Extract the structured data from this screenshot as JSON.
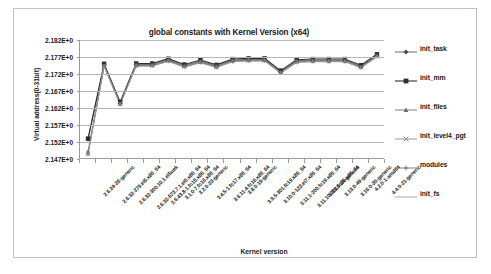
{
  "chart_data": {
    "type": "line",
    "title": "global constants with Kernel Version (x64)",
    "xlabel": "Kernel version",
    "ylabel": "Virtual address(0-31bit)",
    "ylim": [
      2.147,
      2.182
    ],
    "ytick_labels": [
      "2.182E+0",
      "2.177E+0",
      "2.172E+0",
      "2.167E+0",
      "2.162E+0",
      "2.157E+0",
      "2.152E+0",
      "2.147E+0"
    ],
    "ytick_values": [
      2.182,
      2.177,
      2.172,
      2.167,
      2.162,
      2.157,
      2.152,
      2.147
    ],
    "grid": true,
    "legend_position": "right",
    "categories": [
      "2.6.24-26-generic",
      "2.6.32-279.el6.x86_64",
      "2.6.32-300.10.1.el5uek",
      "2.6.32-573.7.1.el6.x86_64",
      "2.6.43.8-1.fc15.x86_64",
      "3.1.0-7.fc16.x86_64",
      "3.2.0-23-generic",
      "3.4.5-1.fc17.x86_64",
      "3.6.11-4.fc16.x86_64",
      "3.8.0-19-generic",
      "3.9.5-301.fc19.x86_64",
      "3.10.0-123.el7.x86_64",
      "3.11.1-200.fc19.x86_64",
      "3.11.10-301.fc20.x86_64",
      "3.13.0-24-generic",
      "3.13.0-49-generic",
      "3.16.0-30-generic",
      "4.2.0-1-amd64",
      "4.4.0-21-generic"
    ],
    "series": [
      {
        "name": "init_task",
        "marker": "diamond",
        "values": [
          2.1528,
          2.1747,
          2.1635,
          2.1748,
          2.1748,
          2.1762,
          2.1745,
          2.1758,
          2.1744,
          2.1761,
          2.1763,
          2.1763,
          2.1727,
          2.1759,
          2.1761,
          2.1761,
          2.1761,
          2.1743,
          2.1775
        ]
      },
      {
        "name": "init_mm",
        "marker": "square",
        "values": [
          2.153,
          2.175,
          2.1638,
          2.1751,
          2.1751,
          2.1765,
          2.1748,
          2.1761,
          2.1747,
          2.1764,
          2.1766,
          2.1766,
          2.173,
          2.1762,
          2.1764,
          2.1764,
          2.1764,
          2.1746,
          2.1778
        ]
      },
      {
        "name": "init_files",
        "marker": "triangle",
        "values": [
          2.1492,
          2.1745,
          2.1633,
          2.1746,
          2.1746,
          2.176,
          2.1743,
          2.1756,
          2.1742,
          2.1759,
          2.1761,
          2.1761,
          2.1725,
          2.1757,
          2.1759,
          2.1759,
          2.1759,
          2.1741,
          2.1773
        ]
      },
      {
        "name": "init_level4_pgt",
        "marker": "cross",
        "values": [
          2.1486,
          2.1744,
          2.1632,
          2.1745,
          2.1745,
          2.1759,
          2.1742,
          2.1755,
          2.1741,
          2.1758,
          2.176,
          2.176,
          2.1724,
          2.1756,
          2.1758,
          2.1758,
          2.1758,
          2.174,
          2.1772
        ]
      },
      {
        "name": "modules",
        "marker": "plus",
        "values": [
          2.1484,
          2.1743,
          2.1631,
          2.1744,
          2.1744,
          2.1758,
          2.1741,
          2.1754,
          2.174,
          2.1757,
          2.1759,
          2.1759,
          2.1723,
          2.1755,
          2.1757,
          2.1757,
          2.1757,
          2.1739,
          2.1771
        ]
      },
      {
        "name": "init_fs",
        "marker": "none",
        "values": [
          2.1483,
          2.1742,
          2.163,
          2.1743,
          2.1743,
          2.1757,
          2.174,
          2.1753,
          2.1739,
          2.1756,
          2.1758,
          2.1758,
          2.1722,
          2.1754,
          2.1756,
          2.1756,
          2.1756,
          2.1738,
          2.177
        ]
      }
    ]
  }
}
